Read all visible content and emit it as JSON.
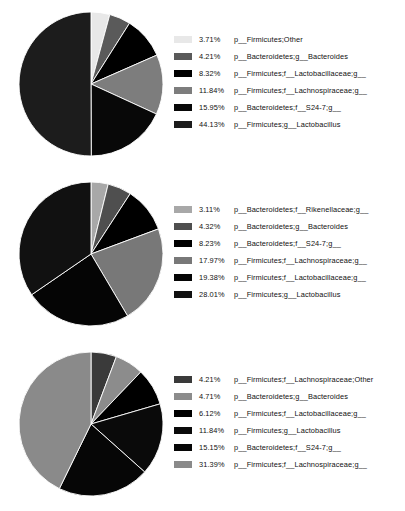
{
  "chart_data": [
    {
      "type": "pie",
      "title": "",
      "legend_position": "right",
      "start_angle_deg": 90,
      "direction": "clockwise",
      "categories": [
        "p__Firmicutes;Other",
        "p__Bacteroidetes;g__Bacteroides",
        "p__Firmicutes;f__Lactobacillaceae;g__",
        "p__Firmicutes;f__Lachnospiraceae;g__",
        "p__Bacteroidetes;f__S24-7;g__",
        "p__Firmicutes;g__Lactobacillus"
      ],
      "values": [
        3.71,
        4.21,
        8.32,
        11.84,
        15.95,
        44.13
      ],
      "value_labels": [
        "3.71%",
        "4.21%",
        "8.32%",
        "11.84%",
        "15.95%",
        "44.13%"
      ],
      "colors": [
        "#e8e8e8",
        "#5a5a5a",
        "#000000",
        "#7d7d7d",
        "#080808",
        "#1c1c1c"
      ]
    },
    {
      "type": "pie",
      "title": "",
      "legend_position": "right",
      "start_angle_deg": 90,
      "direction": "clockwise",
      "categories": [
        "p__Bacteroidetes;f__Rikenellaceae;g__",
        "p__Bacteroidetes;g__Bacteroides",
        "p__Bacteroidetes;f__S24-7;g__",
        "p__Firmicutes;f__Lachnospiraceae;g__",
        "p__Firmicutes;f__Lactobacillaceae;g__",
        "p__Firmicutes;g__Lactobacillus"
      ],
      "values": [
        3.11,
        4.32,
        8.23,
        17.97,
        19.38,
        28.01
      ],
      "value_labels": [
        "3.11%",
        "4.32%",
        "8.23%",
        "17.97%",
        "19.38%",
        "28.01%"
      ],
      "colors": [
        "#a8a8a8",
        "#4f4f4f",
        "#000000",
        "#787878",
        "#050505",
        "#111111"
      ]
    },
    {
      "type": "pie",
      "title": "",
      "legend_position": "right",
      "start_angle_deg": 90,
      "direction": "clockwise",
      "categories": [
        "p__Firmicutes;f__Lachnospiraceae;Other",
        "p__Bacteroidetes;g__Bacteroides",
        "p__Firmicutes;f__Lactobacillaceae;g__",
        "p__Firmicutes;g__Lactobacillus",
        "p__Bacteroidetes;f__S24-7;g__",
        "p__Firmicutes;f__Lachnospiraceae;g__"
      ],
      "values": [
        4.21,
        4.71,
        6.12,
        11.84,
        15.15,
        31.39
      ],
      "value_labels": [
        "4.21%",
        "4.71%",
        "6.12%",
        "11.84%",
        "15.15%",
        "31.39%"
      ],
      "colors": [
        "#3a3a3a",
        "#8c8c8c",
        "#000000",
        "#0a0a0a",
        "#060606",
        "#8a8a8a"
      ]
    }
  ]
}
